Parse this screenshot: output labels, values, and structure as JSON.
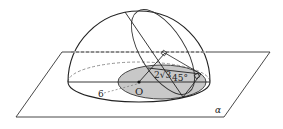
{
  "diagram": {
    "labels": {
      "radius": "6",
      "center": "O",
      "distance": "2√3",
      "distance_coef": "2",
      "distance_rad": "3",
      "angle": "45°",
      "plane": "α"
    },
    "colors": {
      "line": "#222222",
      "dashed": "#555555",
      "shade": "#c8c8c8",
      "background": "#ffffff"
    }
  }
}
